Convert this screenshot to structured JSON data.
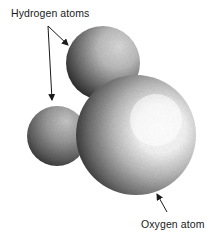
{
  "figure": {
    "labels": {
      "hydrogen": "Hydrogen atoms",
      "oxygen": "Oxygen atom"
    }
  },
  "atoms": [
    {
      "name": "hydrogen-upper",
      "element": "H",
      "cx": 103,
      "cy": 63,
      "r": 37
    },
    {
      "name": "hydrogen-lower",
      "element": "H",
      "cx": 57,
      "cy": 136,
      "r": 30
    },
    {
      "name": "oxygen",
      "element": "O",
      "cx": 136,
      "cy": 135,
      "r": 60
    }
  ],
  "arrows": [
    {
      "name": "arrow-to-upper-hydrogen",
      "from": [
        48,
        26
      ],
      "to": [
        68,
        45
      ]
    },
    {
      "name": "arrow-to-lower-hydrogen",
      "from": [
        48,
        26
      ],
      "to": [
        52,
        100
      ]
    },
    {
      "name": "arrow-to-oxygen",
      "from": [
        167,
        212
      ],
      "to": [
        157,
        194
      ]
    }
  ],
  "colors": {
    "background": "#ffffff",
    "text": "#1a1a1a",
    "sphere_dark": "#2a2a2a",
    "sphere_mid": "#8a8a8a",
    "sphere_light": "#f4f4f4"
  }
}
